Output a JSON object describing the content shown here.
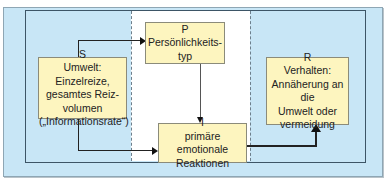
{
  "diagram": {
    "nodes": {
      "S": {
        "letter": "S",
        "lines": [
          "Umwelt: Einzelreize,",
          "gesamtes Reiz-",
          "volumen",
          "(„Informationsrate“)"
        ]
      },
      "P": {
        "letter": "P",
        "lines": [
          "Persönlichkeits-",
          "typ"
        ]
      },
      "I": {
        "letter": "I",
        "lines": [
          "primäre emotionale",
          "Reaktionen"
        ]
      },
      "R": {
        "letter": "R",
        "lines": [
          "Verhalten:",
          "Annäherung an die",
          "Umwelt oder",
          "vermeidung"
        ]
      }
    },
    "edges": [
      {
        "from": "S",
        "to": "P",
        "style": "thin"
      },
      {
        "from": "S",
        "to": "I",
        "style": "thin"
      },
      {
        "from": "P",
        "to": "I",
        "style": "thin"
      },
      {
        "from": "I",
        "to": "R",
        "style": "thick"
      }
    ],
    "colors": {
      "panel_blue": "#c8e6f6",
      "box_fill": "#fdf5bf",
      "center_column": "#ffffff",
      "frame": "#3d5566"
    }
  }
}
